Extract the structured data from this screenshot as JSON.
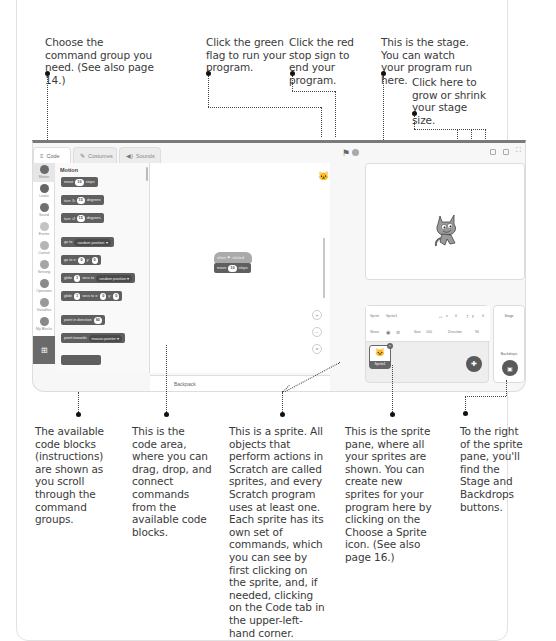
{
  "callouts": {
    "command_group": "Choose the command group you need. (See also page 14.)",
    "green_flag": "Click the green flag to run your program.",
    "stop_sign": "Click the red stop sign to end your program.",
    "stage": "This is the stage. You can watch your program run here.",
    "stage_size": "Click here to grow or shrink your stage size.",
    "code_blocks": "The available code blocks (instructions) are shown as you scroll through the command groups.",
    "code_area": "This is the code area, where you can drag, drop, and connect commands from the available code blocks.",
    "sprite": "This is a sprite. All objects that perform actions in Scratch are called sprites, and every Scratch program uses at least one. Each sprite has its own set of commands, which you can see by first clicking on the sprite, and, if needed, clicking on the Code tab in the upper-left-hand corner.",
    "sprite_pane": "This is the sprite pane, where all your sprites are shown. You can create new sprites for your program here by clicking on the Choose a Sprite icon. (See also page 16.)",
    "stage_backdrops": "To the right of the sprite pane, you'll find the Stage and Backdrops buttons."
  },
  "scratch": {
    "tabs": [
      {
        "label": "Code",
        "icon": "code-icon"
      },
      {
        "label": "Costumes",
        "icon": "brush-icon"
      },
      {
        "label": "Sounds",
        "icon": "speaker-icon"
      }
    ],
    "categories": [
      "Motion",
      "Looks",
      "Sound",
      "Events",
      "Control",
      "Sensing",
      "Operators",
      "Variables",
      "My Blocks"
    ],
    "palette_title": "Motion",
    "blocks": [
      {
        "pre": "move",
        "val": "10",
        "post": "steps"
      },
      {
        "pre": "turn ↻",
        "val": "15",
        "post": "degrees"
      },
      {
        "pre": "turn ↺",
        "val": "15",
        "post": "degrees"
      },
      {
        "pre": "go to",
        "drop": "random position ▾"
      },
      {
        "pre": "go to x:",
        "val": "0",
        "mid": "y:",
        "val2": "0"
      },
      {
        "pre": "glide",
        "val": "1",
        "mid": "secs to",
        "drop": "random position ▾"
      },
      {
        "pre": "glide",
        "val": "1",
        "mid": "secs to x:",
        "val2": "0",
        "mid2": "y:",
        "val3": "0"
      },
      {
        "pre": "point in direction",
        "val": "90"
      },
      {
        "pre": "point towards",
        "drop": "mouse-pointer ▾"
      }
    ],
    "script": {
      "hat": "when ⚑ clicked",
      "move_pre": "move",
      "move_val": "10",
      "move_post": "steps"
    },
    "backpack_label": "Backpack",
    "sprite_info": {
      "sprite_label": "Sprite",
      "sprite_name": "Sprite1",
      "x_label": "x",
      "x_value": "0",
      "y_label": "y",
      "y_value": "0",
      "show_label": "Show",
      "size_label": "Size",
      "size_value": "100",
      "direction_label": "Direction",
      "direction_value": "90"
    },
    "sprite_tile_name": "Sprite1",
    "stage_label": "Stage",
    "backdrops_label": "Backdrops"
  }
}
